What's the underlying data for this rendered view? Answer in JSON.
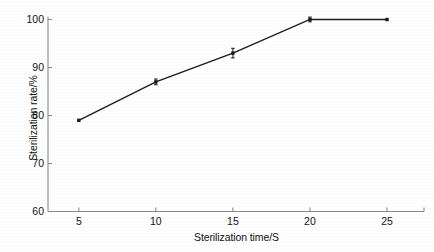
{
  "chart_data": {
    "type": "line",
    "title": "",
    "xlabel": "Sterilization time/S",
    "ylabel": "Sterilization rate/%",
    "x": [
      5,
      10,
      15,
      20,
      25
    ],
    "values": [
      79,
      87,
      93,
      100,
      100
    ],
    "series": [
      {
        "name": "Sterilization rate",
        "values": [
          79,
          87,
          93,
          100,
          100
        ],
        "marker": "square",
        "color": "#1a1a1a",
        "error_bars": [
          0,
          0.6,
          1.0,
          0.5,
          0
        ]
      }
    ],
    "xlim": [
      3.0,
      27.4
    ],
    "ylim": [
      60,
      100
    ],
    "xticks": [
      5,
      10,
      15,
      20,
      25
    ],
    "yticks": [
      60,
      70,
      80,
      90,
      100
    ],
    "xtick_labels": [
      "5",
      "10",
      "15",
      "20",
      "25"
    ],
    "ytick_labels": [
      "60",
      "70",
      "80",
      "90",
      "100"
    ],
    "grid": false,
    "legend": "none",
    "background": "#ffffff",
    "axis_color": "#8a8a8a",
    "line_color": "#1a1a1a"
  }
}
